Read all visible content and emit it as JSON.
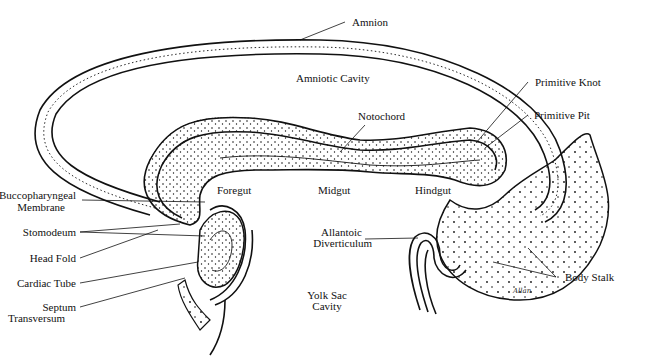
{
  "diagram": {
    "labels": {
      "amnion": "Amnion",
      "amniotic_cavity": "Amniotic Cavity",
      "notochord": "Notochord",
      "primitive_knot": "Primitive Knot",
      "primitive_pit": "Primitive Pit",
      "foregut": "Foregut",
      "midgut": "Midgut",
      "hindgut": "Hindgut",
      "buccopharyngeal_1": "Buccopharyngeal",
      "buccopharyngeal_2": "Membrane",
      "stomodeum": "Stomodeum",
      "head_fold": "Head Fold",
      "cardiac_tube": "Cardiac Tube",
      "septum_1": "Septum",
      "septum_2": "Transversum",
      "allantoic_1": "Allantoic",
      "allantoic_2": "Diverticulum",
      "yolk_1": "Yolk Sac",
      "yolk_2": "Cavity",
      "body_stalk": "Body Stalk",
      "signature": "Allan"
    },
    "colors": {
      "ink": "#111111",
      "paper": "#ffffff"
    }
  }
}
